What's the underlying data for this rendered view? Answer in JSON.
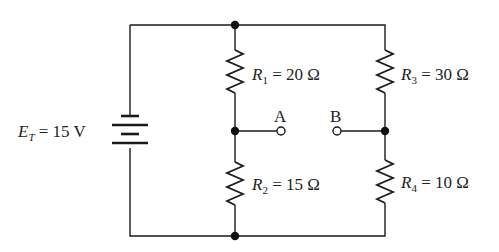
{
  "circuit": {
    "source": {
      "symbol": "E",
      "subscript": "T",
      "equals": " = ",
      "value": "15 V"
    },
    "resistors": [
      {
        "symbol": "R",
        "subscript": "1",
        "equals": " = ",
        "value": "20 Ω"
      },
      {
        "symbol": "R",
        "subscript": "2",
        "equals": " = ",
        "value": "15 Ω"
      },
      {
        "symbol": "R",
        "subscript": "3",
        "equals": " = ",
        "value": "30 Ω"
      },
      {
        "symbol": "R",
        "subscript": "4",
        "equals": " = ",
        "value": "10 Ω"
      }
    ],
    "terminals": [
      {
        "label": "A"
      },
      {
        "label": "B"
      }
    ]
  },
  "colors": {
    "line": "#1a1a1a",
    "background": "#ffffff"
  }
}
